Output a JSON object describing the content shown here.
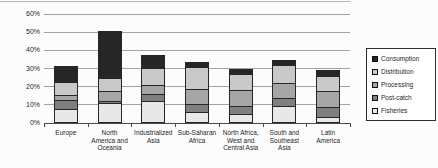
{
  "chart_data": {
    "type": "bar",
    "stacked": true,
    "title": "",
    "xlabel": "",
    "ylabel": "",
    "ylim": [
      0,
      60
    ],
    "ytick_step": 10,
    "yticks": [
      "0%",
      "10%",
      "20%",
      "30%",
      "40%",
      "50%",
      "60%"
    ],
    "grid": "horizontal",
    "legend_position": "right",
    "categories": [
      "Europe",
      "North America and Oceania",
      "Industrialized Asia",
      "Sub-Saharan Africa",
      "North Africa, West and Central Asia",
      "South and Southeast Asia",
      "Latin America"
    ],
    "category_label_lines": [
      [
        "Europe"
      ],
      [
        "North",
        "America and",
        "Oceania"
      ],
      [
        "Industrialized",
        "Asia"
      ],
      [
        "Sub-Saharan",
        "Africa"
      ],
      [
        "North Africa,",
        "West and",
        "Central Asia"
      ],
      [
        "South and",
        "Southeast",
        "Asia"
      ],
      [
        "Latin",
        "America"
      ]
    ],
    "stack_order_bottom_to_top": [
      "Fisheries",
      "Post-catch",
      "Processing",
      "Distribution",
      "Consumption"
    ],
    "series": [
      {
        "name": "Fisheries",
        "color": "#e8e8e8",
        "values": [
          7,
          10.5,
          11.5,
          5.5,
          4.5,
          9,
          2.5
        ]
      },
      {
        "name": "Post-catch",
        "color": "#7f7f7f",
        "values": [
          5,
          1,
          4,
          4.5,
          4.5,
          4,
          5.5
        ]
      },
      {
        "name": "Processing",
        "color": "#a6a6a6",
        "values": [
          3,
          5.5,
          5,
          8,
          8.5,
          8.5,
          9
        ]
      },
      {
        "name": "Distribution",
        "color": "#c9c9c9",
        "values": [
          7,
          7.5,
          9.5,
          12.5,
          9,
          10,
          8.5
        ]
      },
      {
        "name": "Consumption",
        "color": "#262626",
        "values": [
          9,
          25.5,
          7,
          2.5,
          2.5,
          2.5,
          3
        ]
      }
    ],
    "totals": [
      31,
      50,
      37,
      33,
      29,
      34,
      28.5
    ],
    "legend": [
      "Consumption",
      "Distribution",
      "Processing",
      "Post-catch",
      "Fisheries"
    ]
  },
  "colors": {
    "background": "#fcfcfc",
    "grid": "#a3a3a3",
    "axis": "#4a4a4a",
    "bar_border": "#262626",
    "legend_border": "#2e2e2e",
    "text": "#1f1f1f"
  }
}
